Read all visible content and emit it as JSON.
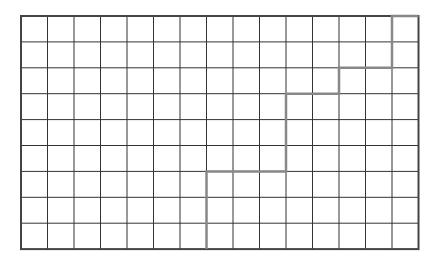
{
  "diagram": {
    "type": "grid-with-staircase-path",
    "columns": 15,
    "rows": 9,
    "origin": {
      "x": 21,
      "y": 16
    },
    "cell_width": 26.5,
    "cell_height": 25.9,
    "grid_color": "#333333",
    "border_color": "#444444",
    "path_color": "#888888",
    "path_cells": [
      [
        7,
        9
      ],
      [
        7,
        6
      ],
      [
        10,
        6
      ],
      [
        10,
        3
      ],
      [
        12,
        3
      ],
      [
        12,
        2
      ],
      [
        14,
        2
      ],
      [
        14,
        0
      ],
      [
        15,
        0
      ]
    ]
  }
}
